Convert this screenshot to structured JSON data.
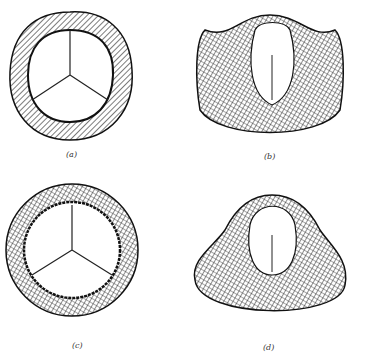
{
  "figure": {
    "panels": [
      {
        "id": "a",
        "label": "(a)",
        "description": "valve top view, closed, roundish-triangular ring"
      },
      {
        "id": "b",
        "label": "(b)",
        "description": "valve side/perspective view, three commissural peaks"
      },
      {
        "id": "c",
        "label": "(c)",
        "description": "valve top view, closed, circular ring"
      },
      {
        "id": "d",
        "label": "(d)",
        "description": "valve perspective view with flared base"
      }
    ]
  }
}
